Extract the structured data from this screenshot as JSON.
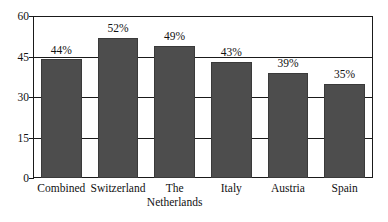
{
  "chart_data": {
    "type": "bar",
    "title": "",
    "subtitle": "",
    "xlabel": "",
    "ylabel": "",
    "categories": [
      "Combined",
      "Switzerland",
      "The Netherlands",
      "Italy",
      "Austria",
      "Spain"
    ],
    "category_lines": [
      [
        "Combined"
      ],
      [
        "Switzerland"
      ],
      [
        "The",
        "Netherlands"
      ],
      [
        "Italy"
      ],
      [
        "Austria"
      ],
      [
        "Spain"
      ]
    ],
    "values": [
      44,
      52,
      49,
      43,
      39,
      35
    ],
    "data_labels": [
      "44%",
      "52%",
      "49%",
      "43%",
      "39%",
      "35%"
    ],
    "ylim": [
      0,
      60
    ],
    "yticks": [
      0,
      15,
      30,
      45,
      60
    ],
    "ytick_labels": [
      "0",
      "15",
      "30",
      "45",
      "60"
    ],
    "grid": true,
    "legend": null,
    "legend_position": "none",
    "bar_color": "#4d4d4d",
    "frame_color": "#1a1a1a",
    "background_color": "#ffffff",
    "text_color": "#111111"
  }
}
